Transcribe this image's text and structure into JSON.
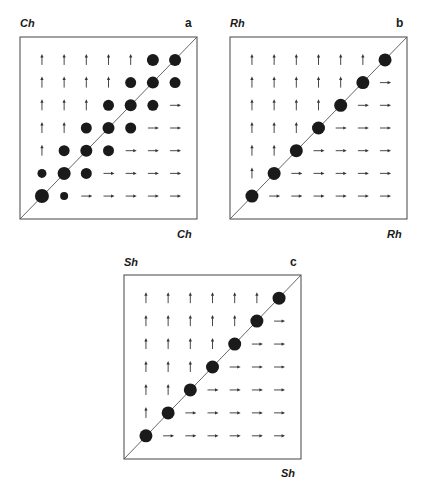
{
  "chart_data": [
    {
      "type": "scatter",
      "panel": "a",
      "title": "",
      "xlabel": "Ch",
      "ylabel": "Ch",
      "grid_size": 7,
      "legend": [],
      "description": "7x7 pairwise grid; filled circles = stable/coexisting states (size = magnitude), up arrows above, right arrows below",
      "cells": [
        [
          "up",
          "up",
          "up",
          "up",
          "up",
          "dot:12",
          "dot:12"
        ],
        [
          "up",
          "up",
          "up",
          "up",
          "dot:11",
          "dot:12",
          "dot:11"
        ],
        [
          "up",
          "up",
          "up",
          "dot:11",
          "dot:12",
          "dot:11",
          "right"
        ],
        [
          "up",
          "up",
          "dot:11",
          "dot:12",
          "dot:11",
          "right",
          "right"
        ],
        [
          "up",
          "dot:11",
          "dot:12",
          "dot:11",
          "right",
          "right",
          "right"
        ],
        [
          "dot:9",
          "dot:13",
          "dot:11",
          "right",
          "right",
          "right",
          "right"
        ],
        [
          "dot:14",
          "dot:8",
          "right",
          "right",
          "right",
          "right",
          "right"
        ]
      ]
    },
    {
      "type": "scatter",
      "panel": "b",
      "title": "",
      "xlabel": "Rh",
      "ylabel": "Rh",
      "grid_size": 7,
      "legend": [],
      "cells": [
        [
          "up",
          "up",
          "up",
          "up",
          "up",
          "up",
          "dot:13"
        ],
        [
          "up",
          "up",
          "up",
          "up",
          "up",
          "dot:13",
          "right"
        ],
        [
          "up",
          "up",
          "up",
          "up",
          "dot:13",
          "right",
          "right"
        ],
        [
          "up",
          "up",
          "up",
          "dot:13",
          "right",
          "right",
          "right"
        ],
        [
          "up",
          "up",
          "dot:13",
          "right",
          "right",
          "right",
          "right"
        ],
        [
          "up",
          "dot:13",
          "right",
          "right",
          "right",
          "right",
          "right"
        ],
        [
          "dot:13",
          "right",
          "right",
          "right",
          "right",
          "right",
          "right"
        ]
      ]
    },
    {
      "type": "scatter",
      "panel": "c",
      "title": "",
      "xlabel": "Sh",
      "ylabel": "Sh",
      "grid_size": 7,
      "legend": [],
      "cells": [
        [
          "up",
          "up",
          "up",
          "up",
          "up",
          "up",
          "dot:13"
        ],
        [
          "up",
          "up",
          "up",
          "up",
          "up",
          "dot:13",
          "right"
        ],
        [
          "up",
          "up",
          "up",
          "up",
          "dot:13",
          "right",
          "right"
        ],
        [
          "up",
          "up",
          "up",
          "dot:13",
          "right",
          "right",
          "right"
        ],
        [
          "up",
          "up",
          "dot:13",
          "right",
          "right",
          "right",
          "right"
        ],
        [
          "up",
          "dot:13",
          "right",
          "right",
          "right",
          "right",
          "right"
        ],
        [
          "dot:13",
          "right",
          "right",
          "right",
          "right",
          "right",
          "right"
        ]
      ]
    }
  ],
  "panels": [
    {
      "letter": "a",
      "xlabel": "Ch",
      "ylabel": "Ch"
    },
    {
      "letter": "b",
      "xlabel": "Rh",
      "ylabel": "Rh"
    },
    {
      "letter": "c",
      "xlabel": "Sh",
      "ylabel": "Sh"
    }
  ],
  "colors": {
    "ink": "#1a1a1a",
    "frame": "#444444",
    "diagonal": "#555555",
    "arrow": "#333333"
  }
}
